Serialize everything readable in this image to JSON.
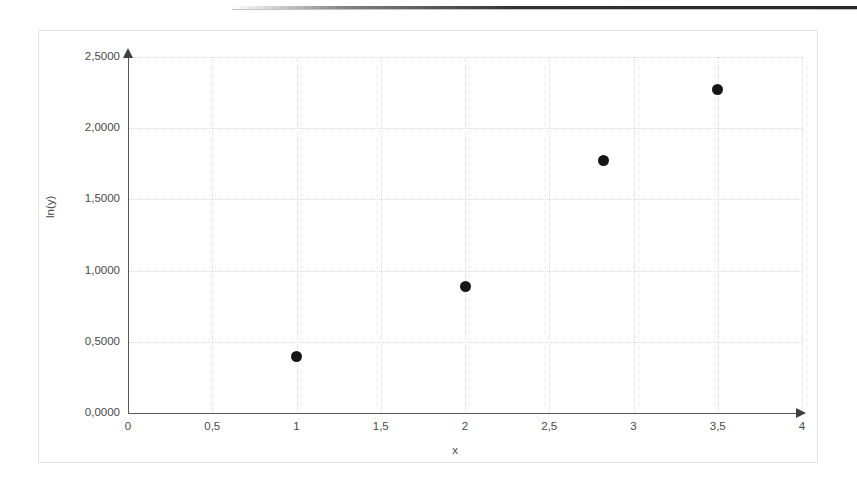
{
  "chart_data": {
    "type": "scatter",
    "title": "",
    "xlabel": "x",
    "ylabel": "ln(y)",
    "xlim": [
      0,
      4
    ],
    "ylim": [
      0,
      2.5
    ],
    "grid": true,
    "legend": "none",
    "decimal_separator": ",",
    "x_tick_labels": [
      "0",
      "0,5",
      "1",
      "1,5",
      "2",
      "2,5",
      "3",
      "3,5",
      "4"
    ],
    "x_tick_values": [
      0,
      0.5,
      1,
      1.5,
      2,
      2.5,
      3,
      3.5,
      4
    ],
    "y_tick_labels": [
      "0,0000",
      "0,5000",
      "1,0000",
      "1,5000",
      "2,0000",
      "2,5000"
    ],
    "y_tick_values": [
      0,
      0.5,
      1.0,
      1.5,
      2.0,
      2.5
    ],
    "points": [
      {
        "x": 1.0,
        "y": 0.4
      },
      {
        "x": 2.0,
        "y": 0.89
      },
      {
        "x": 2.82,
        "y": 1.77
      },
      {
        "x": 3.5,
        "y": 2.27
      }
    ],
    "marker": {
      "shape": "circle",
      "color": "#161616",
      "size_px": 11
    },
    "axis_color": "#595959",
    "grid_color": "#dcdcdc",
    "frame_color": "#e3e3e3",
    "background": "#ffffff"
  }
}
